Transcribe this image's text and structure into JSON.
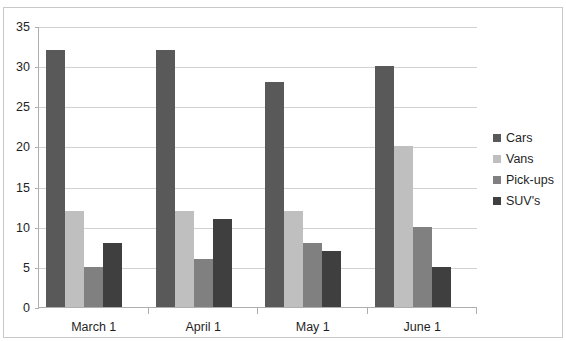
{
  "chart_data": {
    "type": "bar",
    "title": "",
    "xlabel": "",
    "ylabel": "",
    "ylim": [
      0,
      35
    ],
    "yticks": [
      0,
      5,
      10,
      15,
      20,
      25,
      30,
      35
    ],
    "grid": true,
    "legend_position": "right",
    "categories": [
      "March 1",
      "April 1",
      "May 1",
      "June 1"
    ],
    "series": [
      {
        "name": "Cars",
        "color": "#595959",
        "values": [
          32,
          32,
          28,
          30
        ]
      },
      {
        "name": "Vans",
        "color": "#bfbfbf",
        "values": [
          12,
          12,
          12,
          20
        ]
      },
      {
        "name": "Pick-ups",
        "color": "#808080",
        "values": [
          5,
          6,
          8,
          10
        ]
      },
      {
        "name": "SUV's",
        "color": "#3f3f3f",
        "values": [
          8,
          11,
          7,
          5
        ]
      }
    ]
  },
  "clipped_title": "",
  "axis": {
    "y_tick_labels": [
      "0",
      "5",
      "10",
      "15",
      "20",
      "25",
      "30",
      "35"
    ]
  },
  "legend": {
    "items": [
      {
        "label": "Cars"
      },
      {
        "label": "Vans"
      },
      {
        "label": "Pick-ups"
      },
      {
        "label": "SUV's"
      }
    ]
  }
}
